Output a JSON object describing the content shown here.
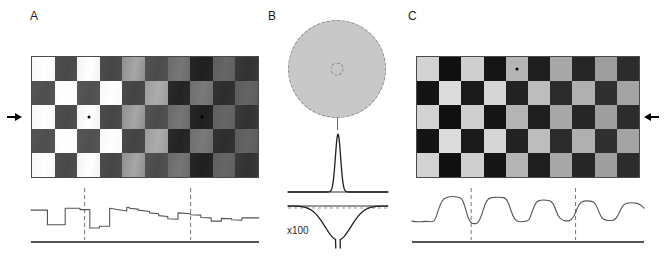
{
  "figure": {
    "width": 667,
    "height": 258,
    "background": "#ffffff"
  },
  "panels": [
    {
      "id": "A",
      "label": "A",
      "role": "input-stimulus"
    },
    {
      "id": "B",
      "label": "B",
      "role": "receptive-field"
    },
    {
      "id": "C",
      "label": "C",
      "role": "normalized-output"
    }
  ],
  "panel_a": {
    "label": "A",
    "board": {
      "columns": 10,
      "rows": 5,
      "description": "checkerboard with contrast and luminance decreasing left to right",
      "column_light": [
        "#f6f6f6",
        "#fbfbfb",
        "#f2f2f2",
        "#f7f7f7",
        "#8e8e8e",
        "#9a9a9a",
        "#6a6a6a",
        "#6e6e6e",
        "#5e5e5e",
        "#5c5c5c"
      ],
      "column_dark": [
        "#555555",
        "#4f4f4f",
        "#565656",
        "#4d4d4d",
        "#4a4a4a",
        "#535353",
        "#2a2a2a",
        "#262626",
        "#343434",
        "#3a3a3a"
      ],
      "gradient_light": [
        "#ffffff",
        "#ffffff",
        "#ffffff",
        "#ffffff",
        "#a6a6a6",
        "#adadad",
        "#767676",
        "#7a7a7a",
        "#666666",
        "#646464"
      ],
      "gradient_dark": [
        "#4f4f4f",
        "#484848",
        "#505050",
        "#454545",
        "#434343",
        "#4b4b4b",
        "#232323",
        "#1f1f1f",
        "#2c2c2c",
        "#323232"
      ]
    },
    "fixation_points": [
      {
        "column": 3,
        "row": 3
      },
      {
        "column": 8,
        "row": 3
      }
    ],
    "arrow": {
      "direction": "right",
      "target_row": 3
    }
  },
  "panel_b": {
    "label": "B",
    "disc": {
      "fill": "#c8c8c8",
      "outline": "dashed"
    },
    "center_marker": {
      "outline": "dashed",
      "shape": "circle"
    },
    "kernel": {
      "center_profile": "narrow positive peak",
      "surround_profile": "broad negative trough",
      "scale_label": "x100"
    }
  },
  "panel_c": {
    "label": "C",
    "board": {
      "columns": 10,
      "rows": 5,
      "description": "checkerboard after contrast normalization, uniform contrast across columns",
      "column_light": [
        "#d2d2d2",
        "#dcdcdc",
        "#cfcfcf",
        "#d6d6d6",
        "#b4b4b4",
        "#bdbdbd",
        "#a8a8a8",
        "#b0b0b0",
        "#9e9e9e",
        "#a4a4a4"
      ],
      "column_dark": [
        "#141414",
        "#101010",
        "#1a1a1a",
        "#151515",
        "#222222",
        "#1e1e1e",
        "#2b2b2b",
        "#262626",
        "#303030",
        "#2c2c2c"
      ]
    },
    "fixation_points": [
      {
        "column": 5,
        "row": 1
      }
    ],
    "arrow": {
      "direction": "left",
      "target_row": 3
    }
  },
  "traces": {
    "panel_a": {
      "description": "luminance profile across middle row; square pulses with decaying amplitude and sloped tops",
      "stroke": "#555555",
      "baseline": true,
      "markers": [
        {
          "x_fraction": 0.235
        },
        {
          "x_fraction": 0.7
        }
      ],
      "points": [
        [
          0.0,
          0.52
        ],
        [
          0.072,
          0.52
        ],
        [
          0.072,
          0.2
        ],
        [
          0.15,
          0.2
        ],
        [
          0.15,
          0.56
        ],
        [
          0.215,
          0.56
        ],
        [
          0.215,
          0.53
        ],
        [
          0.258,
          0.53
        ],
        [
          0.258,
          0.13
        ],
        [
          0.3,
          0.13
        ],
        [
          0.3,
          0.17
        ],
        [
          0.345,
          0.17
        ],
        [
          0.345,
          0.56
        ],
        [
          0.42,
          0.5
        ],
        [
          0.42,
          0.58
        ],
        [
          0.432,
          0.58
        ],
        [
          0.432,
          0.56
        ],
        [
          0.47,
          0.54
        ],
        [
          0.47,
          0.52
        ],
        [
          0.52,
          0.49
        ],
        [
          0.52,
          0.46
        ],
        [
          0.56,
          0.44
        ],
        [
          0.56,
          0.4
        ],
        [
          0.6,
          0.38
        ],
        [
          0.6,
          0.33
        ],
        [
          0.645,
          0.32
        ],
        [
          0.645,
          0.46
        ],
        [
          0.7,
          0.44
        ],
        [
          0.7,
          0.42
        ],
        [
          0.745,
          0.41
        ],
        [
          0.745,
          0.36
        ],
        [
          0.79,
          0.35
        ],
        [
          0.79,
          0.28
        ],
        [
          0.835,
          0.28
        ],
        [
          0.835,
          0.34
        ],
        [
          0.88,
          0.33
        ],
        [
          0.88,
          0.31
        ],
        [
          0.925,
          0.3
        ],
        [
          0.925,
          0.35
        ],
        [
          1.0,
          0.35
        ]
      ]
    },
    "panel_c": {
      "description": "normalized response profile; rounded pulses of nearly uniform amplitude",
      "stroke": "#555555",
      "baseline": true,
      "markers": [
        {
          "x_fraction": 0.255
        },
        {
          "x_fraction": 0.705
        }
      ],
      "points": [
        [
          0.0,
          0.28
        ],
        [
          0.03,
          0.26
        ],
        [
          0.06,
          0.28
        ],
        [
          0.085,
          0.26
        ],
        [
          0.1,
          0.3
        ],
        [
          0.115,
          0.55
        ],
        [
          0.13,
          0.74
        ],
        [
          0.15,
          0.8
        ],
        [
          0.175,
          0.82
        ],
        [
          0.2,
          0.8
        ],
        [
          0.215,
          0.78
        ],
        [
          0.228,
          0.6
        ],
        [
          0.242,
          0.34
        ],
        [
          0.255,
          0.24
        ],
        [
          0.27,
          0.22
        ],
        [
          0.285,
          0.24
        ],
        [
          0.3,
          0.4
        ],
        [
          0.315,
          0.66
        ],
        [
          0.33,
          0.78
        ],
        [
          0.355,
          0.8
        ],
        [
          0.385,
          0.8
        ],
        [
          0.405,
          0.78
        ],
        [
          0.42,
          0.62
        ],
        [
          0.435,
          0.38
        ],
        [
          0.45,
          0.28
        ],
        [
          0.47,
          0.26
        ],
        [
          0.49,
          0.28
        ],
        [
          0.505,
          0.3
        ],
        [
          0.52,
          0.52
        ],
        [
          0.535,
          0.7
        ],
        [
          0.555,
          0.74
        ],
        [
          0.58,
          0.74
        ],
        [
          0.6,
          0.72
        ],
        [
          0.615,
          0.6
        ],
        [
          0.63,
          0.38
        ],
        [
          0.648,
          0.3
        ],
        [
          0.668,
          0.28
        ],
        [
          0.688,
          0.3
        ],
        [
          0.705,
          0.46
        ],
        [
          0.72,
          0.66
        ],
        [
          0.74,
          0.72
        ],
        [
          0.765,
          0.72
        ],
        [
          0.785,
          0.7
        ],
        [
          0.8,
          0.56
        ],
        [
          0.815,
          0.36
        ],
        [
          0.832,
          0.3
        ],
        [
          0.855,
          0.29
        ],
        [
          0.878,
          0.31
        ],
        [
          0.895,
          0.48
        ],
        [
          0.91,
          0.64
        ],
        [
          0.93,
          0.68
        ],
        [
          0.96,
          0.68
        ],
        [
          0.985,
          0.64
        ],
        [
          1.0,
          0.56
        ]
      ]
    }
  }
}
